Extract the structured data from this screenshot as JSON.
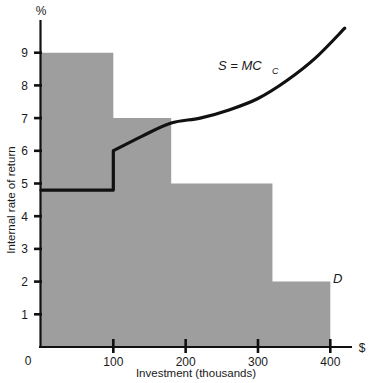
{
  "chart_data": {
    "type": "area",
    "title": "",
    "subtitle": "",
    "xlabel": "Investment (thousands)",
    "ylabel": "Internal rate of return",
    "x_unit_label": "$",
    "y_unit_label": "%",
    "xlim": [
      0,
      430
    ],
    "ylim": [
      0,
      10
    ],
    "grid": false,
    "x_ticks": [
      0,
      100,
      200,
      300,
      400
    ],
    "x_tick_labels": [
      "0",
      "100",
      "200",
      "300",
      "400"
    ],
    "y_ticks": [
      1,
      2,
      3,
      4,
      5,
      6,
      7,
      8,
      9
    ],
    "y_tick_labels": [
      "1",
      "2",
      "3",
      "4",
      "5",
      "6",
      "7",
      "8",
      "9"
    ],
    "zero_label": "0",
    "legend_position": "inline-annotations",
    "series": [
      {
        "name": "D",
        "kind": "step-area",
        "label": "D",
        "fill_color": "#9e9e9e",
        "steps": [
          {
            "x_start": 0,
            "x_end": 100,
            "y": 9
          },
          {
            "x_start": 100,
            "x_end": 180,
            "y": 7
          },
          {
            "x_start": 180,
            "x_end": 320,
            "y": 5
          },
          {
            "x_start": 320,
            "x_end": 400,
            "y": 2
          }
        ]
      },
      {
        "name": "S = MC_C",
        "kind": "line",
        "label_main": "S = MC",
        "label_sub": "C",
        "line_color": "#111111",
        "points": [
          {
            "x": 0,
            "y": 4.8
          },
          {
            "x": 100,
            "y": 4.8
          },
          {
            "x": 100,
            "y": 6.0
          },
          {
            "x": 140,
            "y": 6.45
          },
          {
            "x": 180,
            "y": 6.85
          },
          {
            "x": 220,
            "y": 7.0
          },
          {
            "x": 260,
            "y": 7.25
          },
          {
            "x": 300,
            "y": 7.6
          },
          {
            "x": 340,
            "y": 8.15
          },
          {
            "x": 380,
            "y": 8.85
          },
          {
            "x": 420,
            "y": 9.75
          }
        ]
      }
    ],
    "annotations": [
      {
        "name": "supply-curve-label",
        "text": "S = MC_C",
        "x": 220,
        "y": 8.3
      },
      {
        "name": "demand-curve-label",
        "text": "D",
        "x": 408,
        "y": 2.35
      }
    ]
  }
}
